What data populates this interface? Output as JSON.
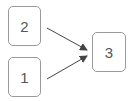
{
  "diagram": {
    "nodes": [
      {
        "id": "n2",
        "label": "2"
      },
      {
        "id": "n1",
        "label": "1"
      },
      {
        "id": "n3",
        "label": "3"
      }
    ],
    "edges": [
      {
        "from": "2",
        "to": "3"
      },
      {
        "from": "1",
        "to": "3"
      }
    ],
    "colors": {
      "border": "#9a9a9a",
      "text": "#555555",
      "edge": "#444444"
    }
  }
}
